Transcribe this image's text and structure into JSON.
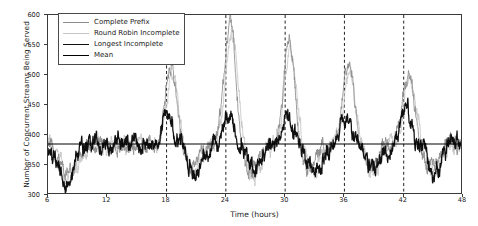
{
  "chart_data": {
    "type": "line",
    "title": "",
    "xlabel": "Time (hours)",
    "ylabel": "Number of Concurrent Streams Being Served",
    "xlim": [
      6,
      48
    ],
    "ylim": [
      300,
      600
    ],
    "xticks": [
      6,
      12,
      18,
      24,
      30,
      36,
      42,
      48
    ],
    "yticks": [
      300,
      350,
      400,
      450,
      500,
      550,
      600
    ],
    "grid": false,
    "legend_position": "upper left",
    "vertical_dashed_lines": [
      18,
      24,
      30,
      36,
      42
    ],
    "mean_value": 385,
    "series": [
      {
        "name": "Complete Prefix",
        "color": "#8c8c8c",
        "style": "solid",
        "baseline": 385,
        "noise": 16,
        "peaks": [
          {
            "x": 18.45,
            "height": 128,
            "width": 1.15
          },
          {
            "x": 24.45,
            "height": 205,
            "width": 1.15
          },
          {
            "x": 30.4,
            "height": 170,
            "width": 1.1
          },
          {
            "x": 36.4,
            "height": 130,
            "width": 1.15
          },
          {
            "x": 42.5,
            "height": 122,
            "width": 1.2
          }
        ],
        "dips": [
          {
            "x": 8.0,
            "depth": 50,
            "width": 1.6
          },
          {
            "x": 20.5,
            "depth": 40,
            "width": 1.3
          },
          {
            "x": 26.5,
            "depth": 46,
            "width": 1.4
          },
          {
            "x": 32.5,
            "depth": 42,
            "width": 1.3
          },
          {
            "x": 38.6,
            "depth": 40,
            "width": 1.3
          },
          {
            "x": 44.6,
            "depth": 42,
            "width": 1.4
          }
        ]
      },
      {
        "name": "Round Robin Incomplete",
        "color": "#c6c6c6",
        "style": "solid",
        "baseline": 385,
        "noise": 17,
        "peaks": [
          {
            "x": 18.6,
            "height": 118,
            "width": 1.2
          },
          {
            "x": 24.6,
            "height": 192,
            "width": 1.2
          },
          {
            "x": 30.55,
            "height": 158,
            "width": 1.15
          },
          {
            "x": 36.55,
            "height": 120,
            "width": 1.2
          },
          {
            "x": 42.65,
            "height": 112,
            "width": 1.25
          }
        ],
        "dips": [
          {
            "x": 8.2,
            "depth": 54,
            "width": 1.7
          },
          {
            "x": 20.8,
            "depth": 46,
            "width": 1.4
          },
          {
            "x": 26.8,
            "depth": 52,
            "width": 1.5
          },
          {
            "x": 32.8,
            "depth": 48,
            "width": 1.4
          },
          {
            "x": 38.9,
            "depth": 46,
            "width": 1.4
          },
          {
            "x": 44.9,
            "depth": 48,
            "width": 1.5
          }
        ]
      },
      {
        "name": "Longest Incomplete",
        "color": "#101010",
        "style": "solid",
        "baseline": 385,
        "noise": 19,
        "peaks": [
          {
            "x": 18.1,
            "height": 50,
            "width": 1.0
          },
          {
            "x": 24.25,
            "height": 55,
            "width": 1.0
          },
          {
            "x": 30.2,
            "height": 52,
            "width": 0.95
          },
          {
            "x": 36.2,
            "height": 52,
            "width": 1.0
          },
          {
            "x": 42.25,
            "height": 58,
            "width": 1.05
          }
        ],
        "dips": [
          {
            "x": 7.8,
            "depth": 66,
            "width": 1.5
          },
          {
            "x": 21.0,
            "depth": 48,
            "width": 1.3
          },
          {
            "x": 27.0,
            "depth": 44,
            "width": 1.3
          },
          {
            "x": 33.0,
            "depth": 44,
            "width": 1.3
          },
          {
            "x": 39.1,
            "depth": 44,
            "width": 1.3
          },
          {
            "x": 45.1,
            "depth": 46,
            "width": 1.3
          }
        ]
      },
      {
        "name": "Mean",
        "color": "#000000",
        "style": "solid-flat",
        "value": 385
      }
    ]
  },
  "legend": {
    "entries": [
      {
        "label": "Complete Prefix",
        "color": "#8c8c8c",
        "thickness": 1
      },
      {
        "label": "Round Robin Incomplete",
        "color": "#c6c6c6",
        "thickness": 1
      },
      {
        "label": "Longest Incomplete",
        "color": "#101010",
        "thickness": 1.6
      },
      {
        "label": "Mean",
        "color": "#000000",
        "thickness": 1.6
      }
    ]
  },
  "axes": {
    "xlabel": "Time (hours)",
    "ylabel": "Number of Concurrent Streams Being Served",
    "xtick_labels": [
      "6",
      "12",
      "18",
      "24",
      "30",
      "36",
      "42",
      "48"
    ],
    "ytick_labels": [
      "300",
      "350",
      "400",
      "450",
      "500",
      "550",
      "600"
    ]
  }
}
